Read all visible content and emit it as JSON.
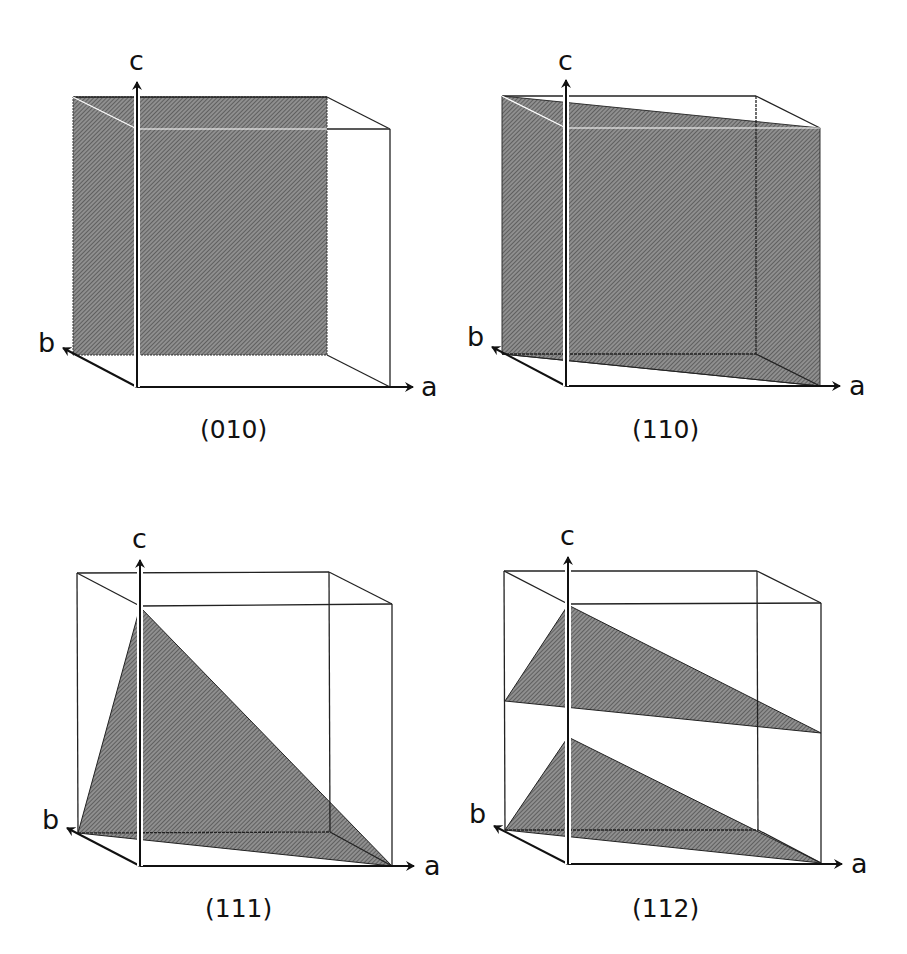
{
  "figure": {
    "colors": {
      "edge": "#222222",
      "axis": "#111111",
      "plane_fill": "#8a8a8a",
      "plane_hatch": "#3c3c3c",
      "background": "#ffffff"
    },
    "axes_labels": {
      "a": "a",
      "b": "b",
      "c": "c"
    },
    "panels": [
      {
        "id": "010",
        "caption": "(010)",
        "plane": "back face of cube (b-c plane at b=1 side)",
        "cube": {
          "back": {
            "tl": [
              73,
              97
            ],
            "tr": [
              327,
              97
            ],
            "bl": [
              73,
              355
            ],
            "br": [
              327,
              355
            ]
          },
          "front": {
            "tl": [
              137,
              129
            ],
            "tr": [
              390,
              129
            ],
            "bl": [
              137,
              387
            ],
            "br": [
              390,
              387
            ]
          }
        },
        "polygons": [
          [
            [
              73,
              97
            ],
            [
              327,
              97
            ],
            [
              327,
              355
            ],
            [
              73,
              355
            ]
          ]
        ]
      },
      {
        "id": "110",
        "caption": "(110)",
        "plane": "diagonal vertical plane",
        "cube": {
          "back": {
            "tl": [
              502,
              96
            ],
            "tr": [
              756,
              96
            ],
            "bl": [
              502,
              354
            ],
            "br": [
              756,
              354
            ]
          },
          "front": {
            "tl": [
              566,
              128
            ],
            "tr": [
              820,
              128
            ],
            "bl": [
              566,
              386
            ],
            "br": [
              820,
              386
            ]
          }
        },
        "polygons": [
          [
            [
              502,
              96
            ],
            [
              820,
              128
            ],
            [
              820,
              386
            ],
            [
              502,
              354
            ]
          ]
        ]
      },
      {
        "id": "111",
        "caption": "(111)",
        "plane": "triangle through a, b, c intercepts",
        "cube": {
          "back": {
            "tl": [
              77,
              573
            ],
            "tr": [
              329,
              572
            ],
            "bl": [
              78,
              833
            ],
            "br": [
              330,
              832
            ]
          },
          "front": {
            "tl": [
              140,
              606
            ],
            "tr": [
              392,
              604
            ],
            "bl": [
              140,
              866
            ],
            "br": [
              392,
              866
            ]
          }
        },
        "polygons": [
          [
            [
              140,
              607
            ],
            [
              78,
              833
            ],
            [
              392,
              866
            ]
          ]
        ]
      },
      {
        "id": "112",
        "caption": "(112)",
        "plane": "two parallel triangular planes",
        "cube": {
          "back": {
            "tl": [
              504,
              571
            ],
            "tr": [
              757,
              571
            ],
            "bl": [
              505,
              830
            ],
            "br": [
              758,
              830
            ]
          },
          "front": {
            "tl": [
              568,
              604
            ],
            "tr": [
              821,
              603
            ],
            "bl": [
              568,
              864
            ],
            "br": [
              821,
              863
            ]
          }
        },
        "polygons": [
          [
            [
              568,
              605
            ],
            [
              505,
              701
            ],
            [
              821,
              733
            ]
          ],
          [
            [
              568,
              737
            ],
            [
              505,
              830
            ],
            [
              821,
              863
            ]
          ]
        ]
      }
    ]
  }
}
